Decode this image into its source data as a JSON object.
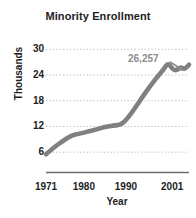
{
  "chart_data": {
    "type": "line",
    "title": "Minority Enrollment",
    "xlabel": "Year",
    "ylabel": "Thousands",
    "grid": true,
    "legend": "none",
    "xlim": [
      1971,
      2005
    ],
    "ylim": [
      3,
      31
    ],
    "yticks": [
      6,
      12,
      18,
      24,
      30
    ],
    "xticks": [
      1971,
      1980,
      1990,
      2001
    ],
    "xtick_labels": [
      "1971",
      "1980",
      "1990",
      "2001"
    ],
    "ytick_labels": [
      "30",
      "24",
      "18",
      "12",
      "6"
    ],
    "series": [
      {
        "name": "Minority Enrollment",
        "color": "#808080",
        "x": [
          1971,
          1973,
          1975,
          1977,
          1979,
          1981,
          1983,
          1985,
          1987,
          1989,
          1991,
          1993,
          1995,
          1997,
          1999,
          2000,
          2001,
          2002,
          2003,
          2004,
          2005
        ],
        "values": [
          5.5,
          7.2,
          8.6,
          9.9,
          10.3,
          10.8,
          11.3,
          11.9,
          12.2,
          12.4,
          14.6,
          17.5,
          20.4,
          23.0,
          25.3,
          26.9,
          25.4,
          25.0,
          25.9,
          25.3,
          26.4
        ]
      }
    ],
    "annotations": [
      {
        "text": "26,257",
        "value": 26257,
        "points_to": "line-end",
        "color": "#8c8c8c"
      }
    ]
  },
  "axis": {
    "y_title": "Thousands",
    "x_title": "Year"
  },
  "colors": {
    "line": "#808080",
    "grid": "#b6b6b6",
    "axis_rule": "#6e6e6e",
    "text": "#1d1d1d",
    "annotation": "#8c8c8c"
  }
}
